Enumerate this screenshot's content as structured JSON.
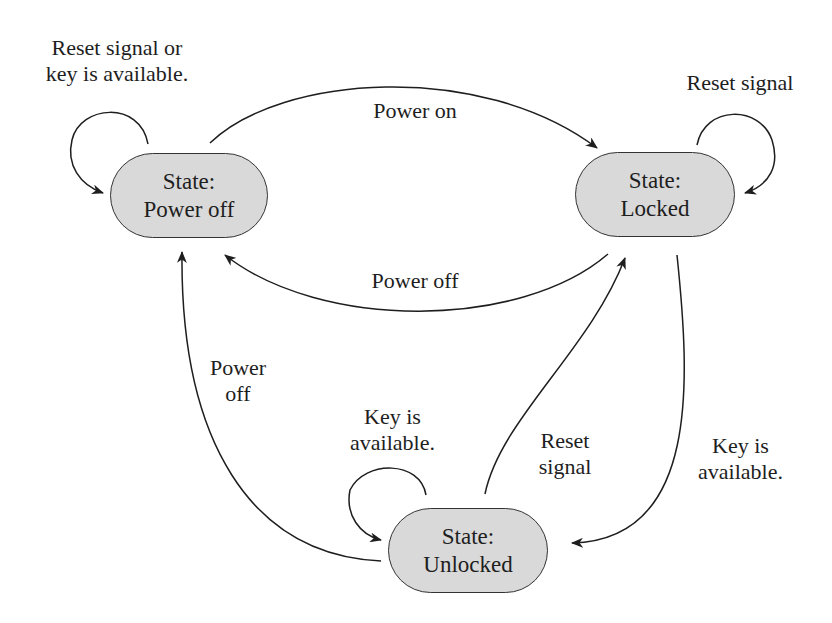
{
  "diagram": {
    "type": "state-machine",
    "states": [
      {
        "id": "power_off",
        "line1": "State:",
        "line2": "Power off"
      },
      {
        "id": "locked",
        "line1": "State:",
        "line2": "Locked"
      },
      {
        "id": "unlocked",
        "line1": "State:",
        "line2": "Unlocked"
      }
    ],
    "transitions": [
      {
        "from": "power_off",
        "to": "power_off",
        "label_line1": "Reset signal or",
        "label_line2": "key is available."
      },
      {
        "from": "power_off",
        "to": "locked",
        "label": "Power on"
      },
      {
        "from": "locked",
        "to": "locked",
        "label": "Reset signal"
      },
      {
        "from": "locked",
        "to": "power_off",
        "label": "Power off"
      },
      {
        "from": "unlocked",
        "to": "power_off",
        "label_line1": "Power",
        "label_line2": "off"
      },
      {
        "from": "unlocked",
        "to": "unlocked",
        "label_line1": "Key is",
        "label_line2": "available."
      },
      {
        "from": "unlocked",
        "to": "locked",
        "label_line1": "Reset",
        "label_line2": "signal"
      },
      {
        "from": "locked",
        "to": "unlocked",
        "label_line1": "Key is",
        "label_line2": "available."
      }
    ]
  }
}
